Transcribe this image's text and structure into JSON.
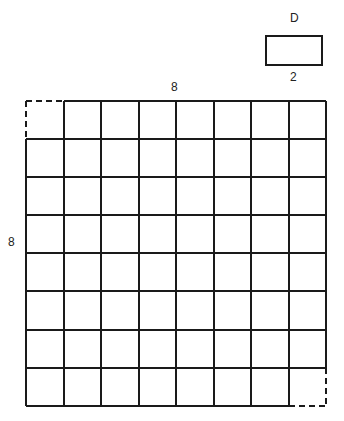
{
  "domino": {
    "label_top": "D",
    "label_bottom": "2"
  },
  "board": {
    "label_top": "8",
    "label_left": "8",
    "rows": 8,
    "cols": 8,
    "removed_corners": [
      "top-left",
      "bottom-right"
    ]
  },
  "colors": {
    "line": "#1a1a1a",
    "background": "#ffffff"
  }
}
